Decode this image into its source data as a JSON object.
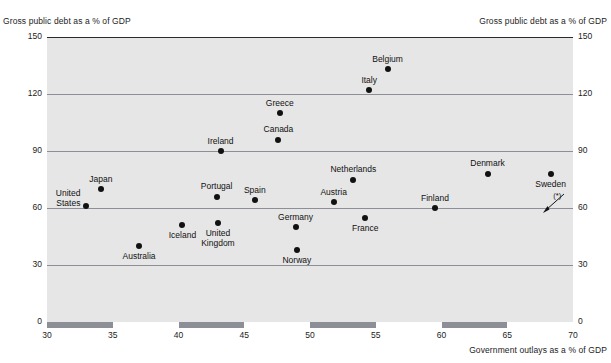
{
  "chart_data": {
    "type": "scatter",
    "title": "",
    "xlabel": "Government outlays as a % of GDP",
    "ylabel": "Gross public debt as a % of GDP",
    "ylabel_right": "Gross public debt as a % of GDP",
    "xlim": [
      30,
      70
    ],
    "ylim": [
      0,
      150
    ],
    "xticks": [
      30,
      35,
      40,
      45,
      50,
      55,
      60,
      65,
      70
    ],
    "yticks": [
      0,
      30,
      60,
      90,
      120,
      150
    ],
    "grid": "horizontal",
    "legend": "none",
    "annotations": [
      {
        "name": "footnote-marker",
        "text": "(*)",
        "x": 68.5,
        "y": 66
      }
    ],
    "axis_bands": [
      {
        "from": 30,
        "to": 35
      },
      {
        "from": 40,
        "to": 45
      },
      {
        "from": 50,
        "to": 55
      },
      {
        "from": 60,
        "to": 65
      }
    ],
    "points": [
      {
        "name": "United States",
        "label": "United\nStates",
        "x": 33.0,
        "y": 61,
        "label_pos": "left-of"
      },
      {
        "name": "Japan",
        "label": "Japan",
        "x": 34.1,
        "y": 70,
        "label_pos": "above"
      },
      {
        "name": "Australia",
        "label": "Australia",
        "x": 37.0,
        "y": 40,
        "label_pos": "below"
      },
      {
        "name": "Iceland",
        "label": "Iceland",
        "x": 40.3,
        "y": 51,
        "label_pos": "below"
      },
      {
        "name": "United Kingdom",
        "label": "United\nKingdom",
        "x": 43.0,
        "y": 52,
        "label_pos": "below"
      },
      {
        "name": "Portugal",
        "label": "Portugal",
        "x": 42.9,
        "y": 66,
        "label_pos": "above"
      },
      {
        "name": "Ireland",
        "label": "Ireland",
        "x": 43.2,
        "y": 90,
        "label_pos": "above"
      },
      {
        "name": "Spain",
        "label": "Spain",
        "x": 45.8,
        "y": 64,
        "label_pos": "above"
      },
      {
        "name": "Greece",
        "label": "Greece",
        "x": 47.7,
        "y": 110,
        "label_pos": "above"
      },
      {
        "name": "Canada",
        "label": "Canada",
        "x": 47.6,
        "y": 96,
        "label_pos": "above"
      },
      {
        "name": "Germany",
        "label": "Germany",
        "x": 48.9,
        "y": 50,
        "label_pos": "above"
      },
      {
        "name": "Norway",
        "label": "Norway",
        "x": 49.0,
        "y": 38,
        "label_pos": "below"
      },
      {
        "name": "Austria",
        "label": "Austria",
        "x": 51.8,
        "y": 63,
        "label_pos": "above"
      },
      {
        "name": "Netherlands",
        "label": "Netherlands",
        "x": 53.3,
        "y": 75,
        "label_pos": "above"
      },
      {
        "name": "France",
        "label": "France",
        "x": 54.2,
        "y": 55,
        "label_pos": "below"
      },
      {
        "name": "Italy",
        "label": "Italy",
        "x": 54.5,
        "y": 122,
        "label_pos": "above"
      },
      {
        "name": "Belgium",
        "label": "Belgium",
        "x": 55.9,
        "y": 133,
        "label_pos": "above"
      },
      {
        "name": "Finland",
        "label": "Finland",
        "x": 59.5,
        "y": 60,
        "label_pos": "above"
      },
      {
        "name": "Denmark",
        "label": "Denmark",
        "x": 63.5,
        "y": 78,
        "label_pos": "above"
      },
      {
        "name": "Sweden",
        "label": "Sweden",
        "x": 68.3,
        "y": 78,
        "label_pos": "below"
      }
    ]
  },
  "colors": {
    "plot_background": "#e6e6e6",
    "gridline": "#8d8f96",
    "point": "#111111",
    "band": "#8d8f96",
    "text": "#1c1c1c"
  }
}
